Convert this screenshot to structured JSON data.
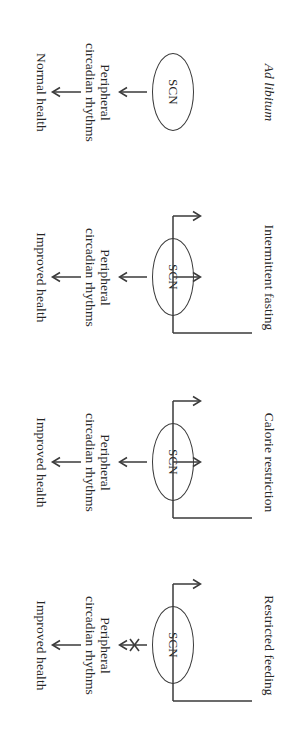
{
  "figure": {
    "type": "diagram",
    "orientation": "rotated-90-clockwise",
    "stroke_color": "#3a3a3a",
    "text_color": "#262626",
    "background": "#ffffff",
    "common_nodes": {
      "scn_label": "SCN",
      "rhythm_label": "Peripheral\ncircadian rhythms"
    },
    "panels": [
      {
        "id": "ad-libitum",
        "condition": "Ad libitum",
        "condition_italic": true,
        "scn": "SCN",
        "rhythms": "Peripheral\ncircadian rhythms",
        "outcome": "Normal health",
        "scn_to_rhythms_arrow": "arrow",
        "condition_feeds_scn": false,
        "condition_feeds_rhythms": false,
        "rhythms_to_outcome_arrow": "arrow"
      },
      {
        "id": "intermittent-fasting",
        "condition": "Intermittent fasting",
        "condition_italic": false,
        "scn": "SCN",
        "rhythms": "Peripheral\ncircadian rhythms",
        "outcome": "Improved health",
        "scn_to_rhythms_arrow": "arrow",
        "condition_feeds_scn": true,
        "condition_feeds_rhythms": true,
        "rhythms_to_outcome_arrow": "arrow"
      },
      {
        "id": "calorie-restriction",
        "condition": "Calorie restriction",
        "condition_italic": false,
        "scn": "SCN",
        "rhythms": "Peripheral\ncircadian rhythms",
        "outcome": "Improved health",
        "scn_to_rhythms_arrow": "arrow",
        "condition_feeds_scn": true,
        "condition_feeds_rhythms": true,
        "rhythms_to_outcome_arrow": "arrow"
      },
      {
        "id": "restricted-feeding",
        "condition": "Restricted feeding",
        "condition_italic": false,
        "scn": "SCN",
        "rhythms": "Peripheral\ncircadian rhythms",
        "outcome": "Improved health",
        "scn_to_rhythms_arrow": "arrow-blocked",
        "condition_feeds_scn": false,
        "condition_feeds_rhythms": true,
        "rhythms_to_outcome_arrow": "arrow"
      }
    ]
  }
}
